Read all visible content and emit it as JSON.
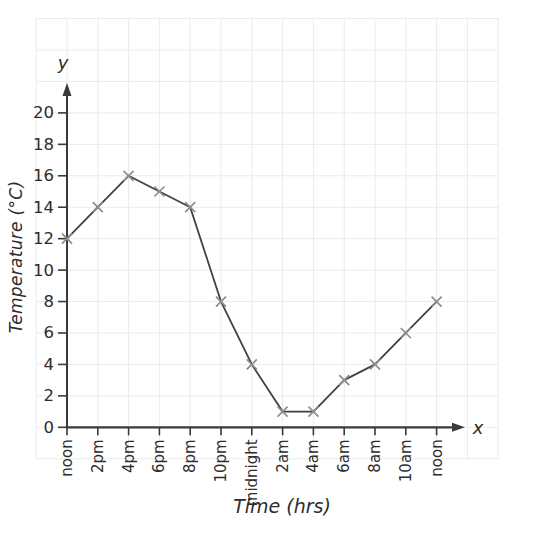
{
  "chart_data": {
    "type": "line",
    "title": "",
    "xlabel": "Time (hrs)",
    "ylabel": "Temperature (°C)",
    "x_arrow_label": "x",
    "y_arrow_label": "y",
    "categories": [
      "noon",
      "2pm",
      "4pm",
      "6pm",
      "8pm",
      "10pm",
      "midnight",
      "2am",
      "4am",
      "6am",
      "8am",
      "10am",
      "noon"
    ],
    "values": [
      12,
      14,
      16,
      15,
      14,
      8,
      4,
      1,
      1,
      3,
      4,
      6,
      8
    ],
    "y_ticks": [
      0,
      2,
      4,
      6,
      8,
      10,
      12,
      14,
      16,
      18,
      20
    ],
    "ylim": [
      0,
      22
    ],
    "grid": true,
    "marker": "x",
    "legend": "none",
    "colors": {
      "line": "#414141",
      "marker": "#8d8d8d",
      "axis": "#3a3a3a",
      "grid": "#ebebeb",
      "text": "#2d2d2d",
      "background": "#ffffff"
    }
  }
}
